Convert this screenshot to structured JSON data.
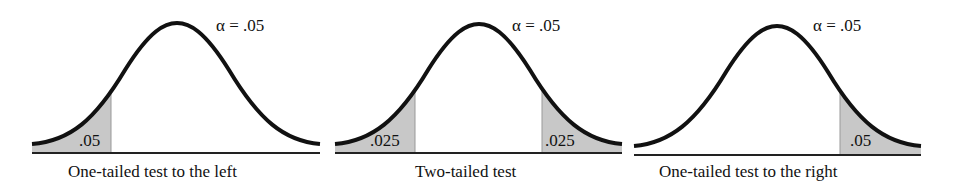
{
  "figure": {
    "panels": [
      {
        "id": "left",
        "alpha_label": "α = .05",
        "tail_labels": [
          ".05"
        ],
        "caption": "One-tailed test to the left"
      },
      {
        "id": "two",
        "alpha_label": "α = .05",
        "tail_labels": [
          ".025",
          ".025"
        ],
        "caption": "Two-tailed test"
      },
      {
        "id": "right",
        "alpha_label": "α = .05",
        "tail_labels": [
          ".05"
        ],
        "caption": "One-tailed test to the right"
      }
    ],
    "colors": {
      "curve": "#111111",
      "shade": "#c8c8c8",
      "baseline": "#222222"
    }
  }
}
